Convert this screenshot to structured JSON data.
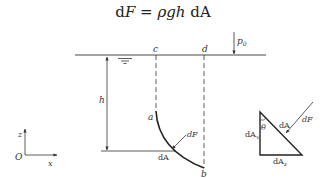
{
  "formula": {
    "lhs_d": "d",
    "lhs_var": "F",
    "eq": " = ",
    "rhs_vars": "ρgh",
    "rhs_d": " d",
    "rhs_A": "A"
  },
  "diagram": {
    "labels": {
      "c": "c",
      "d": "d",
      "p0": "p",
      "p0_sub": "0",
      "h": "h",
      "a": "a",
      "b": "b",
      "dF": "dF",
      "dA": "dA",
      "z_axis": "z",
      "x_axis": "x",
      "origin": "O"
    },
    "triangle": {
      "theta": "θ",
      "dA": "dA",
      "dAx": "dA",
      "dAx_sub": "x",
      "dAz": "dA",
      "dAz_sub": "z",
      "dF": "dF"
    },
    "colors": {
      "stroke": "#333333",
      "background": "#ffffff"
    }
  }
}
